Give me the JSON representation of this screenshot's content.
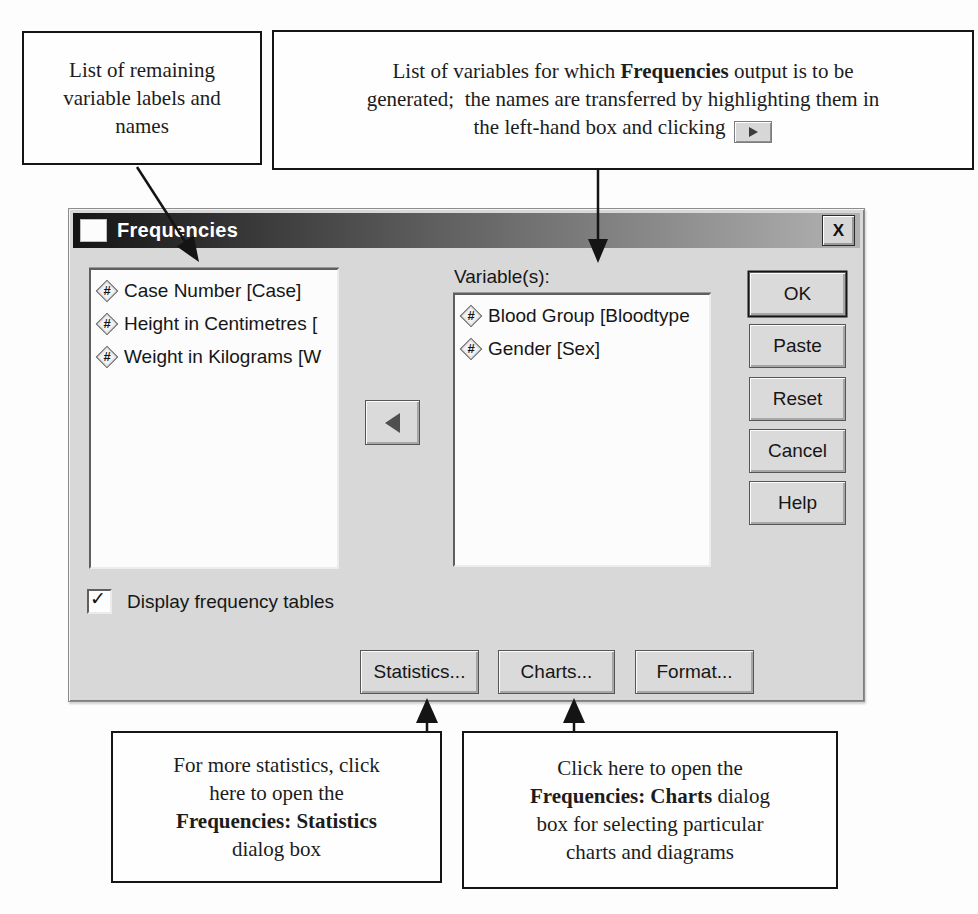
{
  "colors": {
    "page_background": "#fdfdfd",
    "dialog_face": "#d8d8d8",
    "titlebar_gradient_left": "#141414",
    "titlebar_gradient_right": "#b2b2b2",
    "titlebar_text": "#ffffff",
    "callout_border": "#151515",
    "arrow": "#141414",
    "listbox_background": "#fcfcfc"
  },
  "annotations": {
    "top_left": {
      "lines": [
        "List of remaining",
        "variable labels and",
        "names"
      ]
    },
    "top_right": {
      "line1_pre": "List of variables for which ",
      "line1_bold": "Frequencies",
      "line1_post": " output is to be",
      "line2": "generated;  the names are transferred by highlighting them in",
      "line3": "the left-hand box and clicking"
    },
    "bottom_left": {
      "line1": "For more statistics, click",
      "line2": "here to open the",
      "line3_bold": "Frequencies: Statistics",
      "line4": "dialog box"
    },
    "bottom_right": {
      "line1": "Click here to open the",
      "line2_bold": "Frequencies: Charts",
      "line2_post": " dialog",
      "line3": "box for selecting particular",
      "line4": "charts and diagrams"
    }
  },
  "dialog": {
    "title": "Frequencies",
    "close_glyph": "X",
    "source_list": {
      "items": [
        {
          "icon": "#",
          "label": "Case Number [Case]"
        },
        {
          "icon": "#",
          "label": "Height in Centimetres ["
        },
        {
          "icon": "#",
          "label": "Weight in Kilograms [W"
        }
      ]
    },
    "variables_label": "Variable(s):",
    "selected_list": {
      "items": [
        {
          "icon": "#",
          "label": "Blood Group [Bloodtype"
        },
        {
          "icon": "#",
          "label": "Gender [Sex]"
        }
      ]
    },
    "action_buttons": {
      "ok": "OK",
      "paste": "Paste",
      "reset": "Reset",
      "cancel": "Cancel",
      "help": "Help"
    },
    "display_frequency_tables": {
      "label": "Display frequency tables",
      "checked": true,
      "check_glyph": "✓"
    },
    "bottom_buttons": {
      "statistics": "Statistics...",
      "charts": "Charts...",
      "format": "Format..."
    }
  }
}
